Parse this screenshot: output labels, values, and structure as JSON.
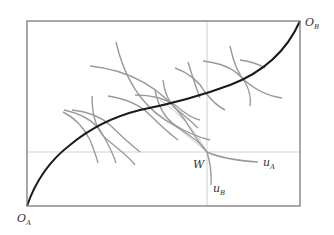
{
  "diagram": {
    "type": "edgeworth-box",
    "labels": {
      "origin_a": "O",
      "origin_a_sub": "A",
      "origin_b": "O",
      "origin_b_sub": "B",
      "endowment": "W",
      "indiff_a": "u",
      "indiff_a_sub": "A",
      "indiff_b": "u",
      "indiff_b_sub": "B"
    },
    "colors": {
      "box": "#7a7a7a",
      "contract_curve": "#1a1a1a",
      "indifference": "#9a9a9a",
      "guide": "#d0d0d0",
      "lens": "#c4c4c4",
      "text": "#333333"
    }
  }
}
